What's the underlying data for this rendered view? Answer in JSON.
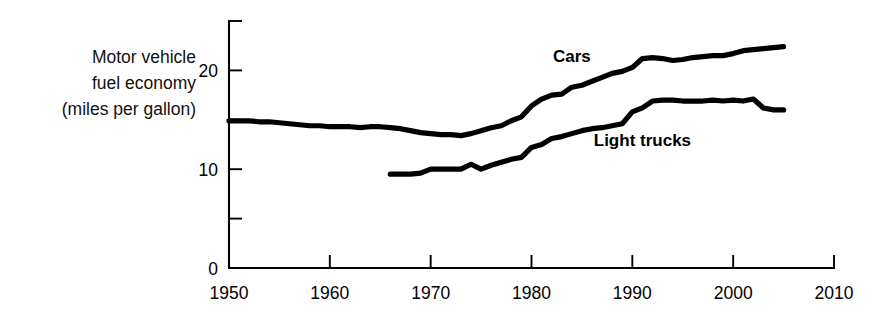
{
  "figure": {
    "background_color": "#ffffff",
    "line_color": "#000000",
    "axis_title_lines": [
      "Motor vehicle",
      "fuel economy",
      "(miles per gallon)"
    ],
    "series_labels": {
      "cars": "Cars",
      "light_trucks": "Light trucks"
    }
  },
  "chart_data": {
    "type": "line",
    "title": "",
    "subtitle": "",
    "xlabel": "",
    "ylabel": "Motor vehicle fuel economy (miles per gallon)",
    "xlim": [
      1950,
      2010
    ],
    "ylim": [
      0,
      25
    ],
    "xticks": [
      1950,
      1960,
      1970,
      1980,
      1990,
      2000,
      2010
    ],
    "xtick_labels": [
      "1950",
      "1960",
      "1970",
      "1980",
      "1990",
      "2000",
      "2010"
    ],
    "yticks": [
      0,
      5,
      10,
      15,
      20,
      25
    ],
    "ytick_labels": [
      "0",
      "",
      "10",
      "",
      "20",
      ""
    ],
    "grid": false,
    "legend": "inline-annotation",
    "annotations": [
      {
        "text": "Cars",
        "x": 1984,
        "y": 20.9
      },
      {
        "text": "Light trucks",
        "x": 1991,
        "y": 12.3
      }
    ],
    "series": [
      {
        "name": "Cars",
        "x": [
          1950,
          1951,
          1952,
          1953,
          1954,
          1955,
          1956,
          1957,
          1958,
          1959,
          1960,
          1961,
          1962,
          1963,
          1964,
          1965,
          1966,
          1967,
          1968,
          1969,
          1970,
          1971,
          1972,
          1973,
          1974,
          1975,
          1976,
          1977,
          1978,
          1979,
          1980,
          1981,
          1982,
          1983,
          1984,
          1985,
          1986,
          1987,
          1988,
          1989,
          1990,
          1991,
          1992,
          1993,
          1994,
          1995,
          1996,
          1997,
          1998,
          1999,
          2000,
          2001,
          2002,
          2003,
          2004,
          2005
        ],
        "y": [
          14.9,
          14.9,
          14.9,
          14.8,
          14.8,
          14.7,
          14.6,
          14.5,
          14.4,
          14.4,
          14.3,
          14.3,
          14.3,
          14.2,
          14.3,
          14.3,
          14.2,
          14.1,
          13.9,
          13.7,
          13.6,
          13.5,
          13.5,
          13.4,
          13.6,
          13.9,
          14.2,
          14.4,
          14.9,
          15.3,
          16.4,
          17.1,
          17.5,
          17.6,
          18.3,
          18.5,
          18.9,
          19.3,
          19.7,
          19.9,
          20.3,
          21.2,
          21.3,
          21.2,
          21.0,
          21.1,
          21.3,
          21.4,
          21.5,
          21.5,
          21.7,
          22.0,
          22.1,
          22.2,
          22.3,
          22.4
        ],
        "color": "#000000"
      },
      {
        "name": "Light trucks",
        "x": [
          1966,
          1967,
          1968,
          1969,
          1970,
          1971,
          1972,
          1973,
          1974,
          1975,
          1976,
          1977,
          1978,
          1979,
          1980,
          1981,
          1982,
          1983,
          1984,
          1985,
          1986,
          1987,
          1988,
          1989,
          1990,
          1991,
          1992,
          1993,
          1994,
          1995,
          1996,
          1997,
          1998,
          1999,
          2000,
          2001,
          2002,
          2003,
          2004,
          2005
        ],
        "y": [
          9.5,
          9.5,
          9.5,
          9.6,
          10.0,
          10.0,
          10.0,
          10.0,
          10.5,
          10.0,
          10.4,
          10.7,
          11.0,
          11.2,
          12.2,
          12.5,
          13.1,
          13.3,
          13.6,
          13.9,
          14.1,
          14.2,
          14.4,
          14.6,
          15.8,
          16.2,
          16.9,
          17.0,
          17.0,
          16.9,
          16.9,
          16.9,
          17.0,
          16.9,
          17.0,
          16.9,
          17.1,
          16.2,
          16.0,
          16.0
        ],
        "color": "#000000"
      }
    ]
  }
}
